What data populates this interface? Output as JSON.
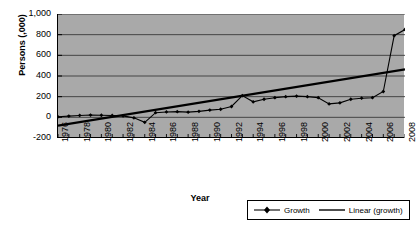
{
  "chart_data": {
    "type": "line",
    "title": "",
    "xlabel": "Year",
    "ylabel": "Persons (,000)",
    "grid": true,
    "legend_position": "bottom-right",
    "xlim": [
      1976,
      2008
    ],
    "ylim": [
      -200,
      1000
    ],
    "ytick_labels": [
      "1,000",
      "800",
      "600",
      "400",
      "200",
      "0",
      "-200"
    ],
    "ytick_values": [
      1000,
      800,
      600,
      400,
      200,
      0,
      -200
    ],
    "xtick_labels": [
      "1976",
      "1978",
      "1980",
      "1982",
      "1984",
      "1986",
      "1988",
      "1990",
      "1992",
      "1994",
      "1996",
      "1998",
      "2000",
      "2002",
      "2004",
      "2006",
      "2008"
    ],
    "xtick_values": [
      1976,
      1978,
      1980,
      1982,
      1984,
      1986,
      1988,
      1990,
      1992,
      1994,
      1996,
      1998,
      2000,
      2002,
      2004,
      2006,
      2008
    ],
    "x": [
      1976,
      1977,
      1978,
      1979,
      1980,
      1981,
      1982,
      1983,
      1984,
      1985,
      1986,
      1987,
      1988,
      1989,
      1990,
      1991,
      1992,
      1993,
      1994,
      1995,
      1996,
      1997,
      1998,
      1999,
      2000,
      2001,
      2002,
      2003,
      2004,
      2005,
      2006,
      2007,
      2008
    ],
    "series": [
      {
        "name": "Growth",
        "marker": "diamond",
        "color": "#000000",
        "values": [
          5,
          10,
          12,
          15,
          10,
          5,
          0,
          -10,
          -45,
          20,
          40,
          45,
          42,
          30,
          35,
          55,
          80,
          100,
          95,
          135,
          160,
          165,
          185,
          190,
          200,
          210,
          195,
          150,
          130,
          160,
          180,
          195,
          175
        ]
      },
      {
        "name": "Linear (growth)",
        "marker": "none",
        "color": "#000000",
        "values": [
          -80,
          -63,
          -46,
          -29,
          -12,
          5,
          22,
          39,
          56,
          73,
          90,
          107,
          124,
          141,
          158,
          175,
          192,
          209,
          226,
          243,
          260,
          277,
          294,
          311,
          328,
          345,
          362,
          379,
          396,
          413,
          430,
          447,
          464
        ]
      }
    ],
    "growth_values_plotted": [
      5,
      12,
      18,
      22,
      20,
      18,
      14,
      -5,
      -48,
      45,
      52,
      55,
      50,
      58,
      70,
      78,
      105,
      210,
      150,
      175,
      190,
      200,
      205,
      200,
      190,
      130,
      140,
      175,
      185,
      190,
      250,
      790,
      850
    ],
    "annotations": []
  },
  "legend": {
    "entries": [
      {
        "label": "Growth",
        "key": "line-with-diamond-marker"
      },
      {
        "label": "Linear (growth)",
        "key": "plain-line"
      }
    ]
  }
}
